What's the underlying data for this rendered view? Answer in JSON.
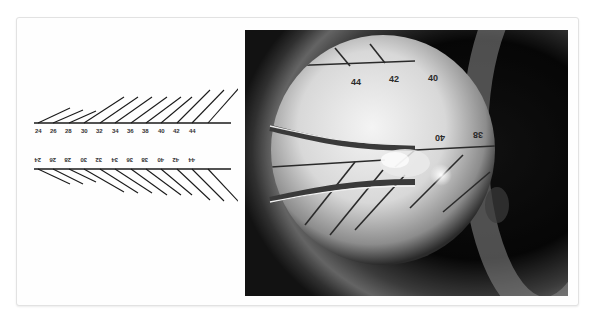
{
  "figure": {
    "diagram": {
      "top_scale_labels": [
        "24",
        "26",
        "28",
        "30",
        "32",
        "34",
        "36",
        "38",
        "40",
        "42",
        "44"
      ],
      "bottom_scale_labels": [
        "24",
        "26",
        "28",
        "30",
        "32",
        "34",
        "36",
        "38",
        "40",
        "42",
        "44"
      ],
      "bottom_labels_inverted": true
    },
    "photo": {
      "description": "Microscope view of a sizing gauge with a curved instrument",
      "upper_labels": [
        "44",
        "42",
        "40"
      ],
      "lower_labels_inverted": [
        "40",
        "38"
      ]
    },
    "colors": {
      "line": "#1a1a1a",
      "frame_border": "#e2e2e2",
      "photo_background": "#050505"
    }
  }
}
